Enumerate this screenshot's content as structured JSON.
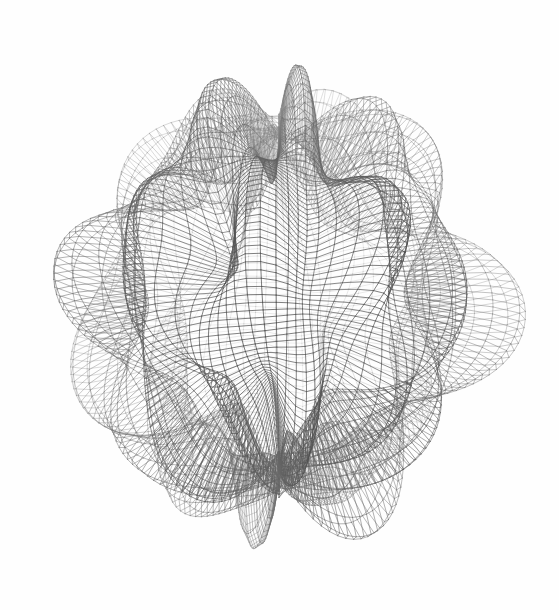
{
  "figure": {
    "title": "Spherical Harmonic Wireframe Surface",
    "width": 559,
    "height": 610,
    "background_color": "#fefefe",
    "render_style": "wireframe-mesh",
    "line_color": "#6e6e6e",
    "line_color_dark": "#4a4a4a",
    "line_color_light": "#9a9a9a",
    "face_color": "#ffffff",
    "line_width": 0.62,
    "axes_visible": false,
    "ticks_visible": false,
    "legend_visible": false,
    "grid_visible": false
  },
  "chart_data": {
    "type": "surface",
    "title": "Spherical Harmonic Wireframe Surface",
    "xlabel": "",
    "ylabel": "",
    "zlabel": "",
    "surface_kind": "spherical-harmonic-radius",
    "parametrization": {
      "u_name": "theta",
      "u_range": [
        0,
        3.141592653589793
      ],
      "u_samples": 90,
      "v_name": "phi",
      "v_range": [
        0,
        6.283185307179586
      ],
      "v_samples": 96
    },
    "radius_function": {
      "base_radius": 1.0,
      "terms": [
        {
          "amplitude": 0.26,
          "m": 10,
          "n": 3,
          "phase_u": 0.0,
          "phase_v": 0.0
        },
        {
          "amplitude": 0.13,
          "m": 4,
          "n": 5,
          "phase_u": 0.6,
          "phase_v": 0.35
        },
        {
          "amplitude": 0.075,
          "m": 7,
          "n": 2,
          "phase_u": 1.1,
          "phase_v": 0.9
        },
        {
          "amplitude": 0.05,
          "m": 2,
          "n": 7,
          "phase_u": 0.25,
          "phase_v": 1.7
        }
      ]
    },
    "lobe_count_equator": 10,
    "lobe_count_meridian": 3,
    "polar_features": [
      {
        "name": "north-pole-crater",
        "screen_x": 305,
        "screen_y": 95,
        "kind": "depression"
      },
      {
        "name": "upper-left-saddle",
        "screen_x": 175,
        "screen_y": 160,
        "kind": "saddle"
      },
      {
        "name": "lower-fold",
        "screen_x": 310,
        "screen_y": 500,
        "kind": "crease"
      }
    ],
    "camera": {
      "elevation_deg": 22,
      "azimuth_deg": -38,
      "roll_deg": 0,
      "projection": "orthographic",
      "scale": 182
    },
    "shading": {
      "mode": "line-density",
      "light_direction": [
        -0.45,
        -0.55,
        0.7
      ],
      "ambient": 0.42,
      "min_gray": 60,
      "max_gray": 172
    },
    "bounding_box_px": {
      "left": 12,
      "top": 14,
      "right": 547,
      "bottom": 596
    },
    "center_px": {
      "x": 279,
      "y": 305
    }
  }
}
